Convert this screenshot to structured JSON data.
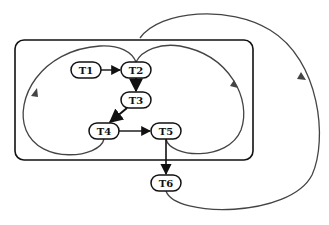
{
  "diagram": {
    "type": "task-flow-graph",
    "colors": {
      "edge": "#111111",
      "loop": "#444444",
      "container": "#111111",
      "background": "#ffffff"
    },
    "container": {
      "label": ""
    },
    "nodes": [
      {
        "id": "T1",
        "label": "T1"
      },
      {
        "id": "T2",
        "label": "T2"
      },
      {
        "id": "T3",
        "label": "T3"
      },
      {
        "id": "T4",
        "label": "T4"
      },
      {
        "id": "T5",
        "label": "T5"
      },
      {
        "id": "T6",
        "label": "T6"
      }
    ],
    "edges": [
      {
        "from": "T1",
        "to": "T2"
      },
      {
        "from": "T2",
        "to": "T3"
      },
      {
        "from": "T3",
        "to": "T4"
      },
      {
        "from": "T4",
        "to": "T5"
      },
      {
        "from": "T5",
        "to": "T6"
      }
    ],
    "feedback_loops": [
      {
        "from": "T4",
        "to": "T2",
        "side": "left"
      },
      {
        "from": "T5",
        "to": "T2",
        "side": "right-inner"
      },
      {
        "from": "T6",
        "to": "T2",
        "side": "right-outer"
      }
    ]
  }
}
